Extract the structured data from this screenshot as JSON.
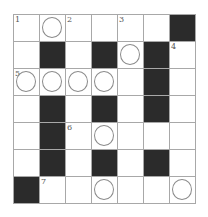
{
  "puzzle": {
    "type": "crossword",
    "rows": 7,
    "cols": 7,
    "colors": {
      "black": "#2b2b2b",
      "line": "#a8a8a8",
      "circle": "#8a8a8a"
    },
    "grid": [
      [
        {
          "n": "1"
        },
        {
          "c": 1
        },
        {
          "n": "2"
        },
        {},
        {
          "n": "3"
        },
        {},
        {
          "b": 1
        }
      ],
      [
        {},
        {
          "b": 1
        },
        {},
        {
          "b": 1
        },
        {
          "c": 1
        },
        {
          "b": 1
        },
        {
          "n": "4"
        }
      ],
      [
        {
          "n": "5",
          "c": 1
        },
        {
          "c": 1
        },
        {
          "c": 1
        },
        {
          "c": 1
        },
        {},
        {
          "b": 1
        },
        {}
      ],
      [
        {},
        {
          "b": 1
        },
        {},
        {
          "b": 1
        },
        {},
        {
          "b": 1
        },
        {}
      ],
      [
        {},
        {
          "b": 1
        },
        {
          "n": "6"
        },
        {
          "c": 1
        },
        {},
        {},
        {}
      ],
      [
        {},
        {
          "b": 1
        },
        {},
        {
          "b": 1
        },
        {},
        {
          "b": 1
        },
        {}
      ],
      [
        {
          "b": 1
        },
        {
          "n": "7"
        },
        {},
        {
          "c": 1
        },
        {},
        {},
        {
          "c": 1
        }
      ]
    ]
  }
}
